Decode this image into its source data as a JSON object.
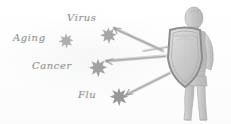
{
  "illustration": {
    "title": "Immune defense shield sketch",
    "style": "pencil sketch grayscale",
    "background_color": "#fefefe",
    "ink_color": "#8f8f8f"
  },
  "threats": [
    {
      "label": "Virus",
      "germ_color": "#9b9b9b"
    },
    {
      "label": "Aging",
      "germ_color": "#a3a3a3"
    },
    {
      "label": "Cancer",
      "germ_color": "#979797"
    },
    {
      "label": "Flu",
      "germ_color": "#8e8e8e"
    }
  ],
  "defender": {
    "shield_label": "immunity",
    "shield_color": "#b9b9b9",
    "body_color": "#c9c9c9"
  }
}
